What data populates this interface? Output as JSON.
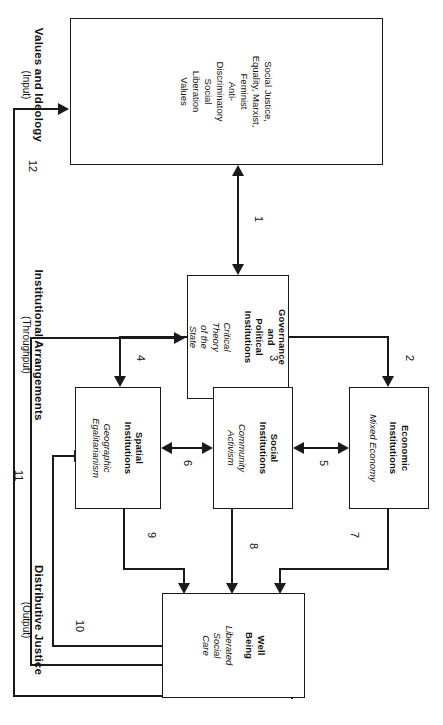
{
  "diagram": {
    "sections": [
      {
        "id": "input",
        "main": "Values and Ideology",
        "sub": "(Input)"
      },
      {
        "id": "throughput",
        "main": "Institutional Arrangements",
        "sub": "(Throughput)"
      },
      {
        "id": "output",
        "main": "Distributive Justice",
        "sub": "(Output)"
      }
    ],
    "boxes": [
      {
        "id": "values",
        "title": "",
        "subtitle": "Social Justice,\nEquality, Marxist,\nFeminist\nAnti-\nDiscriminatory\nSocial\nLiberation\nValues",
        "style": "plain"
      },
      {
        "id": "governance",
        "title": "Governance\nand\nPolitical\nInstitutions",
        "subtitle": "Critical\nTheory\nof the\nState"
      },
      {
        "id": "economic",
        "title": "Economic\nInstitutions",
        "subtitle": "Mixed Economy"
      },
      {
        "id": "social",
        "title": "Social\nInstitutions",
        "subtitle": "Community\nActivism"
      },
      {
        "id": "spatial",
        "title": "Spatial\nInstitutions",
        "subtitle": "Geographic\nEgalitarianism"
      },
      {
        "id": "wellbeing",
        "title": "Well\nBeing",
        "subtitle": "Liberated\nSocial\nCare"
      }
    ],
    "connectors": [
      {
        "label": "1",
        "from": "values",
        "to": "governance",
        "kind": "bidirectional"
      },
      {
        "label": "2",
        "from": "governance",
        "to": "economic",
        "kind": "directed"
      },
      {
        "label": "3",
        "from": "governance",
        "to": "social",
        "kind": "directed"
      },
      {
        "label": "4",
        "from": "governance",
        "to": "spatial",
        "kind": "directed"
      },
      {
        "label": "5",
        "from": "economic",
        "to": "social",
        "kind": "bidirectional"
      },
      {
        "label": "6",
        "from": "social",
        "to": "spatial",
        "kind": "bidirectional"
      },
      {
        "label": "7",
        "from": "economic",
        "to": "wellbeing",
        "kind": "directed"
      },
      {
        "label": "8",
        "from": "social",
        "to": "wellbeing",
        "kind": "directed"
      },
      {
        "label": "9",
        "from": "spatial",
        "to": "wellbeing",
        "kind": "directed"
      },
      {
        "label": "10",
        "from": "wellbeing",
        "to": "spatial",
        "kind": "feedback"
      },
      {
        "label": "11",
        "from": "wellbeing",
        "to": "governance",
        "kind": "feedback"
      },
      {
        "label": "12",
        "from": "wellbeing",
        "to": "values",
        "kind": "feedback"
      }
    ]
  }
}
